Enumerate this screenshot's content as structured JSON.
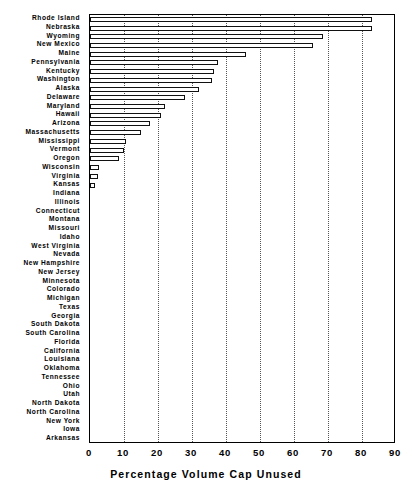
{
  "chart_data": {
    "type": "bar",
    "orientation": "horizontal",
    "title": "",
    "xlabel": "Percentage Volume Cap Unused",
    "ylabel": "",
    "xlim": [
      0,
      90
    ],
    "ylim": null,
    "grid": true,
    "grid_axis": "x",
    "grid_style": "dotted",
    "legend": null,
    "xticks": [
      0,
      10,
      20,
      30,
      40,
      50,
      60,
      70,
      80,
      90
    ],
    "xtick_labels": [
      "0",
      "10",
      "20",
      "30",
      "40",
      "50",
      "60",
      "70",
      "80",
      "90"
    ],
    "categories": [
      "Rhode Island",
      "Nebraska",
      "Wyoming",
      "New Mexico",
      "Maine",
      "Pennsylvania",
      "Kentucky",
      "Washington",
      "Alaska",
      "Delaware",
      "Maryland",
      "Hawaii",
      "Arizona",
      "Massachusetts",
      "Mississippi",
      "Vermont",
      "Oregon",
      "Wisconsin",
      "Virginia",
      "Kansas",
      "Indiana",
      "Illinois",
      "Connecticut",
      "Montana",
      "Missouri",
      "Idaho",
      "West Virginia",
      "Nevada",
      "New Hampshire",
      "New Jersey",
      "Minnesota",
      "Colorado",
      "Michigan",
      "Texas",
      "Georgia",
      "South Dakota",
      "South Carolina",
      "Florida",
      "California",
      "Louisiana",
      "Oklahoma",
      "Tennessee",
      "Ohio",
      "Utah",
      "North Dakota",
      "North Carolina",
      "New York",
      "Iowa",
      "Arkansas"
    ],
    "values": [
      83.0,
      83.0,
      68.5,
      65.5,
      46.0,
      37.5,
      36.5,
      36.0,
      32.0,
      28.0,
      22.0,
      21.0,
      17.5,
      15.0,
      10.5,
      10.0,
      8.5,
      2.5,
      2.3,
      1.5,
      0.0,
      0.0,
      0.0,
      0.0,
      0.0,
      0.0,
      0.0,
      0.0,
      0.0,
      0.0,
      0.0,
      0.0,
      0.0,
      0.0,
      0.0,
      0.0,
      0.0,
      0.0,
      0.0,
      0.0,
      0.0,
      0.0,
      0.0,
      0.0,
      0.0,
      0.0,
      0.0,
      0.0,
      0.0
    ],
    "colors": {
      "bar_fill": "#ffffff",
      "bar_edge": "#111111",
      "axis": "#000000",
      "grid": "#555555",
      "background": "#ffffff",
      "text": "#000000"
    }
  }
}
